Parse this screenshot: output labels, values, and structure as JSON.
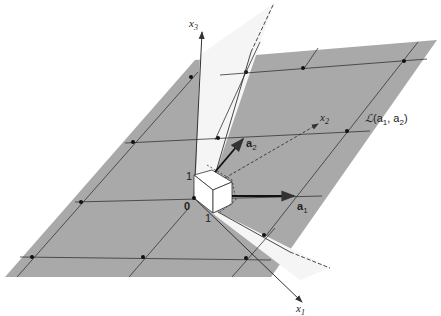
{
  "diagram": {
    "colors": {
      "plane": "#a9a9a9",
      "wedge": "#f4f4f4",
      "lines": "#333333",
      "background": "#ffffff"
    },
    "axes": {
      "x1": {
        "label": "x",
        "sub": "1"
      },
      "x2": {
        "label": "x",
        "sub": "2"
      },
      "x3": {
        "label": "x",
        "sub": "3"
      }
    },
    "vectors": {
      "a1": {
        "label": "a",
        "sub": "1"
      },
      "a2": {
        "label": "a",
        "sub": "2"
      }
    },
    "origin_label": "0",
    "unit_labels": {
      "x3_unit": "1",
      "x1_unit": "1"
    },
    "span_label": {
      "script": "ℒ",
      "text": "(a",
      "sub1": "1",
      "mid": ", a",
      "sub2": "2",
      "end": ")"
    }
  }
}
